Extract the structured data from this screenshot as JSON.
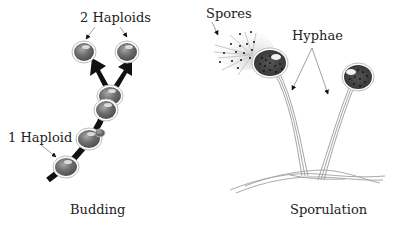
{
  "budding": {
    "title": "Budding",
    "label_two": "2 Haploids",
    "label_one": "1 Haploid"
  },
  "sporulation": {
    "title": "Sporulation",
    "label_spores": "Spores",
    "label_hyphae": "Hyphae"
  },
  "colors": {
    "cell_fill": "#6b6b6b",
    "cell_outline": "#bdbdbd",
    "sporangium_fill": "#4a4a4a",
    "stalk": "#9a9a9a",
    "arrow": "#111111"
  }
}
